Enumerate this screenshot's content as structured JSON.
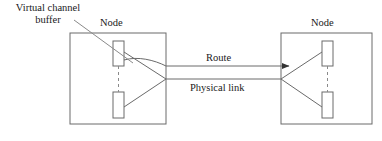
{
  "diagram": {
    "labels": {
      "virtual_channel_buffer": "Virtual channel buffer",
      "node_left": "Node",
      "node_right": "Node",
      "route": "Route",
      "physical_link": "Physical link"
    },
    "colors": {
      "stroke": "#555555",
      "text": "#1a1a1a",
      "background": "#ffffff",
      "arrow_fill": "#333333"
    },
    "nodes": [
      {
        "name": "node-left",
        "label": "Node",
        "box": {
          "x": 70,
          "y": 33,
          "width": 96,
          "height": 91
        },
        "buffers": [
          {
            "name": "buffer-top-left",
            "x": 113,
            "y": 41,
            "width": 11,
            "height": 25
          },
          {
            "name": "buffer-bottom-left",
            "x": 113,
            "y": 92,
            "width": 11,
            "height": 26
          }
        ]
      },
      {
        "name": "node-right",
        "label": "Node",
        "box": {
          "x": 281,
          "y": 33,
          "width": 91,
          "height": 91
        },
        "buffers": [
          {
            "name": "buffer-top-right",
            "x": 322,
            "y": 41,
            "width": 11,
            "height": 25
          },
          {
            "name": "buffer-bottom-right",
            "x": 322,
            "y": 92,
            "width": 11,
            "height": 26
          }
        ]
      }
    ],
    "links": [
      {
        "name": "route-link",
        "x1": 166,
        "y1": 66,
        "x2": 296,
        "y2": 66,
        "arrow": true
      },
      {
        "name": "physical-link",
        "x1": 166,
        "y1": 79,
        "x2": 281,
        "y2": 79,
        "arrow": false
      }
    ],
    "buffer_dashed_connectors": [
      {
        "name": "dashed-connector-left",
        "x": 118,
        "y1": 66,
        "y2": 92
      },
      {
        "name": "dashed-connector-right",
        "x": 327,
        "y1": 66,
        "y2": 92
      }
    ],
    "leader_line": {
      "name": "virtual-channel-buffer-leader",
      "x1": 74,
      "y1": 20,
      "x2": 132,
      "y2": 62
    }
  }
}
